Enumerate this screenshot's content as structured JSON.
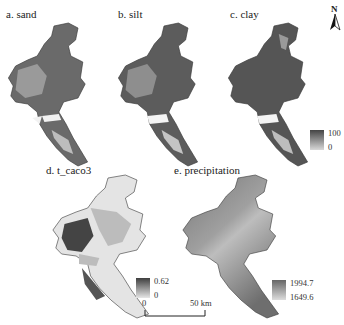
{
  "figure": {
    "panels": [
      {
        "id": "a",
        "title": "a. sand"
      },
      {
        "id": "b",
        "title": "b. silt"
      },
      {
        "id": "c",
        "title": "c. clay"
      },
      {
        "id": "d",
        "title": "d. t_caco3"
      },
      {
        "id": "e",
        "title": "e. precipitation"
      }
    ],
    "legends": {
      "clay": {
        "max": "100",
        "min": "0"
      },
      "t_caco3": {
        "max": "0.62",
        "min": "0"
      },
      "precipitation": {
        "max": "1994.7",
        "min": "1649.6"
      }
    },
    "north_arrow": {
      "label": "N"
    },
    "scale_bar": {
      "start": "0",
      "end": "50 km"
    }
  },
  "colors": {
    "map_dark": "#5e5e5e",
    "map_mid": "#8a8a8a",
    "map_light": "#cfcfcf",
    "map_white": "#f2f2f2",
    "outline": "#3a3a3a"
  }
}
